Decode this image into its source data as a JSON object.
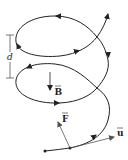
{
  "diagram": {
    "type": "helical-trajectory",
    "labels": {
      "spacing": "d",
      "field": "B",
      "force": "F",
      "velocity": "u"
    },
    "colors": {
      "stroke": "#222222",
      "vector": "#555555",
      "background": "#ffffff"
    }
  }
}
